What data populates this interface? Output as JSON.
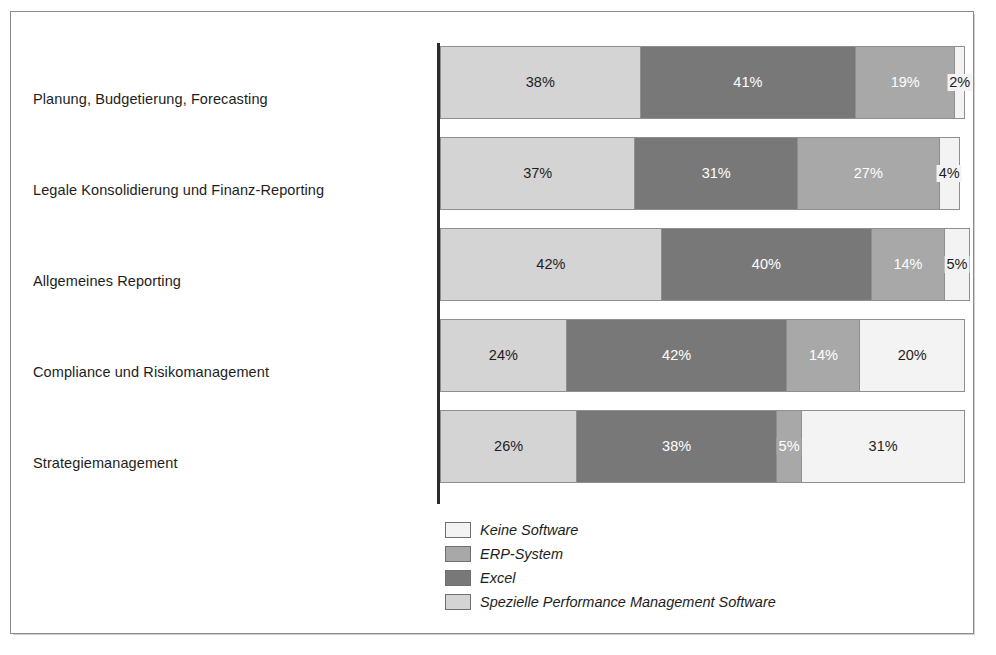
{
  "figure": {
    "background_color": "#ffffff",
    "frame_color": "#8b8b8b",
    "axis_color": "#2b2b2b"
  },
  "chart_data": {
    "type": "bar",
    "subtype": "stacked-horizontal-100-percent",
    "title": "",
    "subtitle": "",
    "xlabel": "",
    "ylabel": "",
    "xlim": [
      0,
      100
    ],
    "grid": false,
    "legend_position": "bottom-left-of-plot",
    "legend_order": [
      "Keine Software",
      "ERP-System",
      "Excel",
      "Spezielle Performance Management Software"
    ],
    "stack_order": [
      "Spezielle Performance Management Software",
      "Excel",
      "ERP-System",
      "Keine Software"
    ],
    "categories": [
      "Planung, Budgetierung, Forecasting",
      "Legale Konsolidierung und Finanz-Reporting",
      "Allgemeines Reporting",
      "Compliance und Risikomanagement",
      "Strategiemanagement"
    ],
    "series": [
      {
        "name": "Spezielle Performance Management Software",
        "color": "#d4d4d4",
        "label_color": "dark",
        "values": [
          38,
          37,
          42,
          24,
          26
        ],
        "labels": [
          "38%",
          "37%",
          "42%",
          "24%",
          "26%"
        ]
      },
      {
        "name": "Excel",
        "color": "#787878",
        "label_color": "light",
        "values": [
          41,
          31,
          40,
          42,
          38
        ],
        "labels": [
          "41%",
          "31%",
          "40%",
          "42%",
          "38%"
        ]
      },
      {
        "name": "ERP-System",
        "color": "#a8a8a8",
        "label_color": "light",
        "values": [
          19,
          27,
          14,
          14,
          5
        ],
        "labels": [
          "19%",
          "27%",
          "14%",
          "14%",
          "5%"
        ]
      },
      {
        "name": "Keine Software",
        "color": "#f3f3f3",
        "label_color": "dark",
        "values": [
          2,
          4,
          5,
          20,
          31
        ],
        "labels": [
          "2%",
          "4%",
          "5%",
          "20%",
          "31%"
        ]
      }
    ],
    "bar_totals": [
      100,
      99,
      101,
      100,
      100
    ]
  },
  "legend": {
    "items": [
      {
        "label": "Keine Software",
        "color": "#f3f3f3"
      },
      {
        "label": "ERP-System",
        "color": "#a8a8a8"
      },
      {
        "label": "Excel",
        "color": "#787878"
      },
      {
        "label": "Spezielle Performance Management Software",
        "color": "#d4d4d4"
      }
    ]
  }
}
